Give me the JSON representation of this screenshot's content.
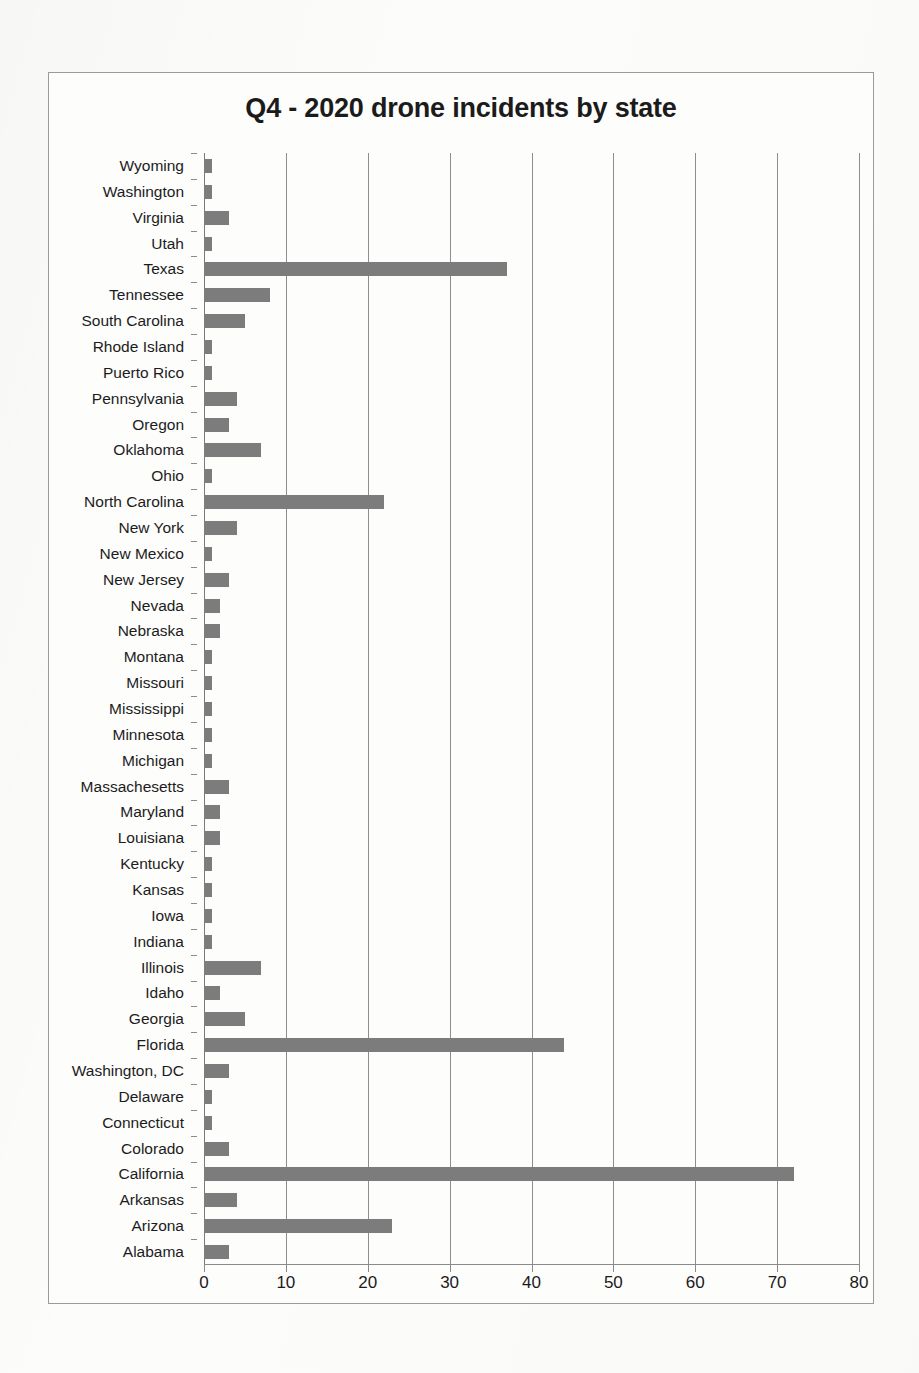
{
  "chart_data": {
    "type": "bar",
    "orientation": "horizontal",
    "title": "Q4 - 2020 drone incidents by state",
    "xlabel": "",
    "ylabel": "",
    "xlim": [
      0,
      80
    ],
    "xticks": [
      0,
      10,
      20,
      30,
      40,
      50,
      60,
      70,
      80
    ],
    "grid": true,
    "legend": false,
    "bar_color": "#7c7c7c",
    "categories": [
      "Wyoming",
      "Washington",
      "Virginia",
      "Utah",
      "Texas",
      "Tennessee",
      "South Carolina",
      "Rhode Island",
      "Puerto Rico",
      "Pennsylvania",
      "Oregon",
      "Oklahoma",
      "Ohio",
      "North Carolina",
      "New York",
      "New Mexico",
      "New Jersey",
      "Nevada",
      "Nebraska",
      "Montana",
      "Missouri",
      "Mississippi",
      "Minnesota",
      "Michigan",
      "Massachesetts",
      "Maryland",
      "Louisiana",
      "Kentucky",
      "Kansas",
      "Iowa",
      "Indiana",
      "Illinois",
      "Idaho",
      "Georgia",
      "Florida",
      "Washington, DC",
      "Delaware",
      "Connecticut",
      "Colorado",
      "California",
      "Arkansas",
      "Arizona",
      "Alabama"
    ],
    "values": [
      1,
      1,
      3,
      1,
      37,
      8,
      5,
      1,
      1,
      4,
      3,
      7,
      1,
      22,
      4,
      1,
      3,
      2,
      2,
      1,
      1,
      1,
      1,
      1,
      3,
      2,
      2,
      1,
      1,
      1,
      1,
      7,
      2,
      5,
      44,
      3,
      1,
      1,
      3,
      72,
      4,
      23,
      3
    ]
  }
}
